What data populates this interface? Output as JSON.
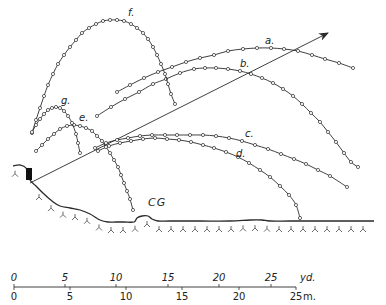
{
  "figure": {
    "colors": {
      "ink": "#2a2a2a",
      "background": "#ffffff"
    }
  },
  "trajectories": [
    {
      "id": "a",
      "label": "a.",
      "label_pos": [
        265,
        44
      ],
      "points": [
        [
          117,
          92
        ],
        [
          130,
          85
        ],
        [
          144,
          78
        ],
        [
          158,
          72
        ],
        [
          172,
          67
        ],
        [
          186,
          62
        ],
        [
          200,
          58
        ],
        [
          214,
          55
        ],
        [
          228,
          51
        ],
        [
          243,
          49
        ],
        [
          257,
          48
        ],
        [
          271,
          48
        ],
        [
          284,
          49
        ],
        [
          298,
          51
        ],
        [
          312,
          55
        ],
        [
          325,
          59
        ],
        [
          339,
          63
        ],
        [
          353,
          68
        ]
      ]
    },
    {
      "id": "b",
      "label": "b.",
      "label_pos": [
        240,
        67
      ],
      "points": [
        [
          97,
          116
        ],
        [
          111,
          107
        ],
        [
          125,
          99
        ],
        [
          139,
          92
        ],
        [
          153,
          84
        ],
        [
          166,
          79
        ],
        [
          180,
          73
        ],
        [
          194,
          69
        ],
        [
          205,
          68
        ],
        [
          216,
          68
        ],
        [
          228,
          69
        ],
        [
          240,
          71
        ],
        [
          251,
          74
        ],
        [
          262,
          78
        ],
        [
          273,
          83
        ],
        [
          283,
          89
        ],
        [
          293,
          96
        ],
        [
          302,
          104
        ],
        [
          311,
          113
        ],
        [
          320,
          122
        ],
        [
          328,
          132
        ],
        [
          336,
          142
        ],
        [
          344,
          153
        ],
        [
          351,
          162
        ],
        [
          358,
          167
        ]
      ]
    },
    {
      "id": "c",
      "label": "c.",
      "label_pos": [
        245,
        137
      ],
      "points": [
        [
          95,
          148
        ],
        [
          106,
          143
        ],
        [
          117,
          140
        ],
        [
          128,
          138
        ],
        [
          140,
          136
        ],
        [
          152,
          135
        ],
        [
          165,
          135
        ],
        [
          177,
          135
        ],
        [
          190,
          135
        ],
        [
          203,
          135
        ],
        [
          216,
          136
        ],
        [
          229,
          138
        ],
        [
          242,
          141
        ],
        [
          255,
          145
        ],
        [
          268,
          149
        ],
        [
          281,
          154
        ],
        [
          294,
          159
        ],
        [
          306,
          164
        ],
        [
          318,
          170
        ],
        [
          330,
          176
        ],
        [
          347,
          187
        ]
      ]
    },
    {
      "id": "d",
      "label": "d.",
      "label_pos": [
        236,
        157
      ],
      "points": [
        [
          98,
          151
        ],
        [
          109,
          146
        ],
        [
          120,
          143
        ],
        [
          131,
          141
        ],
        [
          143,
          139
        ],
        [
          155,
          138
        ],
        [
          167,
          139
        ],
        [
          179,
          140
        ],
        [
          191,
          142
        ],
        [
          203,
          145
        ],
        [
          214,
          148
        ],
        [
          226,
          152
        ],
        [
          238,
          157
        ],
        [
          249,
          163
        ],
        [
          260,
          170
        ],
        [
          270,
          177
        ],
        [
          280,
          186
        ],
        [
          289,
          195
        ],
        [
          296,
          205
        ],
        [
          300,
          218
        ]
      ]
    },
    {
      "id": "e",
      "label": "e.",
      "label_pos": [
        79,
        121
      ],
      "points": [
        [
          36,
          151
        ],
        [
          42,
          145
        ],
        [
          48,
          139
        ],
        [
          54,
          134
        ],
        [
          60,
          129
        ],
        [
          67,
          126
        ],
        [
          74,
          125
        ],
        [
          80,
          126
        ],
        [
          86,
          128
        ],
        [
          92,
          131
        ],
        [
          97,
          136
        ],
        [
          102,
          141
        ],
        [
          106,
          147
        ],
        [
          110,
          153
        ],
        [
          114,
          160
        ],
        [
          118,
          167
        ],
        [
          121,
          175
        ],
        [
          124,
          183
        ],
        [
          127,
          191
        ],
        [
          130,
          199
        ],
        [
          133,
          210
        ]
      ]
    },
    {
      "id": "f",
      "label": "f.",
      "label_pos": [
        128,
        16
      ],
      "points": [
        [
          32,
          133
        ],
        [
          36,
          120
        ],
        [
          40,
          108
        ],
        [
          44,
          96
        ],
        [
          48,
          85
        ],
        [
          53,
          74
        ],
        [
          58,
          64
        ],
        [
          64,
          55
        ],
        [
          70,
          47
        ],
        [
          76,
          40
        ],
        [
          82,
          33
        ],
        [
          89,
          28
        ],
        [
          96,
          24
        ],
        [
          103,
          21
        ],
        [
          110,
          20
        ],
        [
          117,
          20
        ],
        [
          124,
          21
        ],
        [
          131,
          24
        ],
        [
          137,
          28
        ],
        [
          143,
          33
        ],
        [
          148,
          39
        ],
        [
          153,
          47
        ],
        [
          157,
          55
        ],
        [
          161,
          64
        ],
        [
          165,
          74
        ],
        [
          168,
          84
        ],
        [
          171,
          94
        ],
        [
          175,
          104
        ]
      ]
    },
    {
      "id": "g",
      "label": "g.",
      "label_pos": [
        61,
        104
      ],
      "points": [
        [
          32,
          132
        ],
        [
          36,
          125
        ],
        [
          40,
          119
        ],
        [
          44,
          114
        ],
        [
          48,
          110
        ],
        [
          52,
          108
        ],
        [
          56,
          107
        ],
        [
          60,
          108
        ],
        [
          64,
          111
        ],
        [
          68,
          116
        ],
        [
          72,
          123
        ],
        [
          76,
          134
        ],
        [
          78,
          143
        ],
        [
          80,
          153
        ]
      ]
    }
  ],
  "short_segments": [
    {
      "id": "a-start",
      "points": [
        [
          117,
          92
        ],
        [
          126,
          86
        ]
      ]
    },
    {
      "id": "b-start",
      "points": [
        [
          97,
          116
        ],
        [
          107,
          109
        ]
      ]
    }
  ],
  "arrow": {
    "from": [
      30,
      183
    ],
    "to": [
      328,
      33
    ]
  },
  "launch_block": {
    "x": 26,
    "y": 168,
    "w": 6,
    "h": 12
  },
  "ground_label": {
    "text": "CG",
    "pos": [
      148,
      206
    ]
  },
  "ground_profile": [
    [
      13,
      166
    ],
    [
      20,
      165
    ],
    [
      26,
      168
    ],
    [
      30,
      180
    ],
    [
      36,
      186
    ],
    [
      44,
      194
    ],
    [
      52,
      201
    ],
    [
      60,
      206
    ],
    [
      70,
      208
    ],
    [
      80,
      210
    ],
    [
      90,
      214
    ],
    [
      100,
      220
    ],
    [
      108,
      222
    ],
    [
      116,
      222
    ],
    [
      124,
      222
    ],
    [
      134,
      222
    ],
    [
      137,
      218
    ],
    [
      142,
      216
    ],
    [
      148,
      216
    ],
    [
      152,
      219
    ],
    [
      158,
      221
    ],
    [
      170,
      221
    ],
    [
      200,
      221
    ],
    [
      230,
      221
    ],
    [
      250,
      220
    ],
    [
      262,
      220
    ],
    [
      270,
      221
    ],
    [
      290,
      221
    ],
    [
      320,
      221
    ],
    [
      350,
      221
    ],
    [
      374,
      221
    ]
  ],
  "scale": {
    "yd_label": "yd.",
    "m_label": "m.",
    "yd_ticks": [
      {
        "label": "0",
        "x": 14
      },
      {
        "label": "5",
        "x": 65
      },
      {
        "label": "10",
        "x": 116
      },
      {
        "label": "15",
        "x": 168
      },
      {
        "label": "20",
        "x": 219
      },
      {
        "label": "25",
        "x": 271
      }
    ],
    "m_ticks": [
      {
        "label": "0",
        "x": 14
      },
      {
        "label": "5",
        "x": 70
      },
      {
        "label": "10",
        "x": 126
      },
      {
        "label": "15",
        "x": 182
      },
      {
        "label": "20",
        "x": 239
      },
      {
        "label": "25",
        "x": 296
      }
    ],
    "line_y": 287,
    "x_start": 14,
    "x_end": 296
  }
}
